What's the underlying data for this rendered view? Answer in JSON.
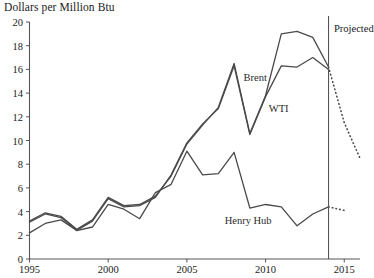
{
  "chart_data": {
    "type": "line",
    "title": "Dollars per Million Btu",
    "xlabel": "",
    "ylabel": "Dollars per Million Btu",
    "xlim": [
      1995,
      2016
    ],
    "ylim": [
      0,
      20
    ],
    "yticks": [
      0,
      2,
      4,
      6,
      8,
      10,
      12,
      14,
      16,
      18,
      20
    ],
    "ytick_labels": [
      "0",
      "2",
      "4",
      "6",
      "8",
      "10",
      "12",
      "14",
      "16",
      "18",
      "20"
    ],
    "xticks": [
      1995,
      2000,
      2005,
      2010,
      2015
    ],
    "xtick_labels": [
      "1995",
      "2000",
      "2005",
      "2010",
      "2015"
    ],
    "grid": false,
    "legend": "inline-annotations",
    "line_color": "#4a4a4a",
    "axis_color": "#555555",
    "background": "#ffffff",
    "annotations": [
      {
        "text": "Brent",
        "x": 2008.6,
        "y": 15.2
      },
      {
        "text": "WTI",
        "x": 2010.2,
        "y": 12.6
      },
      {
        "text": "Henry Hub",
        "x": 2007.4,
        "y": 3.1
      },
      {
        "text": "Projected",
        "x": 2014.35,
        "y": 19.3
      }
    ],
    "divider": {
      "x": 2014,
      "label": "Projected",
      "y_top": 20,
      "y_bottom": 0
    },
    "series": [
      {
        "name": "Brent",
        "style": "solid",
        "x": [
          1995,
          1996,
          1997,
          1998,
          1999,
          2000,
          2001,
          2002,
          2003,
          2004,
          2005,
          2006,
          2007,
          2008,
          2009,
          2010,
          2011,
          2012,
          2013,
          2014
        ],
        "values": [
          3.2,
          3.9,
          3.6,
          2.5,
          3.3,
          5.2,
          4.5,
          4.6,
          5.3,
          7.0,
          9.7,
          11.3,
          12.8,
          16.5,
          10.6,
          13.8,
          19.0,
          19.2,
          18.7,
          16.2
        ]
      },
      {
        "name": "WTI",
        "style": "solid",
        "x": [
          1995,
          1996,
          1997,
          1998,
          1999,
          2000,
          2001,
          2002,
          2003,
          2004,
          2005,
          2006,
          2007,
          2008,
          2009,
          2010,
          2011,
          2012,
          2013,
          2014
        ],
        "values": [
          3.1,
          3.8,
          3.5,
          2.4,
          3.2,
          5.1,
          4.4,
          4.5,
          5.2,
          7.1,
          9.8,
          11.4,
          12.7,
          16.3,
          10.5,
          13.7,
          16.3,
          16.2,
          17.0,
          16.0
        ]
      },
      {
        "name": "Henry Hub",
        "style": "solid",
        "x": [
          1995,
          1996,
          1997,
          1998,
          1999,
          2000,
          2001,
          2002,
          2003,
          2004,
          2005,
          2006,
          2007,
          2008,
          2009,
          2010,
          2011,
          2012,
          2013,
          2014
        ],
        "values": [
          2.2,
          3.0,
          3.3,
          2.4,
          2.7,
          4.6,
          4.2,
          3.4,
          5.6,
          6.3,
          9.1,
          7.1,
          7.2,
          9.0,
          4.3,
          4.6,
          4.4,
          2.8,
          3.8,
          4.4
        ]
      },
      {
        "name": "Brent projection",
        "style": "dotted",
        "x": [
          2014,
          2015,
          2016
        ],
        "values": [
          16.2,
          11.5,
          8.5
        ]
      },
      {
        "name": "Henry Hub projection",
        "style": "dotted",
        "x": [
          2014,
          2015
        ],
        "values": [
          4.4,
          4.1
        ]
      }
    ]
  },
  "labels": {
    "axis_title": "Dollars per Million Btu",
    "brent": "Brent",
    "wti": "WTI",
    "henry_hub": "Henry Hub",
    "projected": "Projected"
  }
}
